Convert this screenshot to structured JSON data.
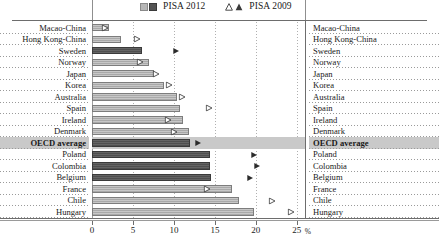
{
  "legend": {
    "series_2012_label": "PISA 2012",
    "series_2009_label": "PISA 2009",
    "swatch_light_color": "#b6b6b6",
    "swatch_dark_color": "#545454",
    "triangle_open_name": "triangle-open-icon",
    "triangle_filled_name": "triangle-filled-icon"
  },
  "axis": {
    "ticks": [
      "0",
      "5",
      "10",
      "15",
      "20",
      "25"
    ],
    "unit": "%",
    "min": 0,
    "max": 26,
    "gridlines": true
  },
  "chart_data": {
    "type": "bar",
    "title": "",
    "xlabel": "%",
    "ylabel": "",
    "xlim": [
      0,
      26
    ],
    "grid": true,
    "legend_position": "top",
    "categories": [
      "Macao-China",
      "Hong Kong-China",
      "Sweden",
      "Norway",
      "Japan",
      "Korea",
      "Australia",
      "Spain",
      "Ireland",
      "Denmark",
      "OECD average",
      "Poland",
      "Colombia",
      "Belgium",
      "France",
      "Chile",
      "Hungary"
    ],
    "series": [
      {
        "name": "PISA 2012",
        "type": "bar",
        "values": [
          2.1,
          3.6,
          6.1,
          7.0,
          7.6,
          8.8,
          10.4,
          10.7,
          11.1,
          11.8,
          12.0,
          14.4,
          14.4,
          14.5,
          17.1,
          17.9,
          19.8
        ]
      },
      {
        "name": "PISA 2009",
        "type": "marker",
        "values": [
          1.6,
          5.5,
          10.3,
          5.8,
          7.8,
          9.4,
          11.0,
          14.3,
          9.3,
          10.0,
          12.9,
          19.8,
          20.2,
          19.3,
          14.0,
          22.0,
          24.3
        ]
      }
    ],
    "bar_shading": [
      "light",
      "light",
      "dark",
      "light",
      "light",
      "light",
      "light",
      "light",
      "light",
      "light",
      "dark",
      "dark",
      "dark",
      "dark",
      "light",
      "light",
      "light"
    ],
    "marker_shading": [
      "open",
      "open",
      "filled",
      "open",
      "open",
      "open",
      "open",
      "open",
      "open",
      "open",
      "filled",
      "filled",
      "filled",
      "filled",
      "open",
      "open",
      "open"
    ],
    "highlight_row": "OECD average"
  }
}
